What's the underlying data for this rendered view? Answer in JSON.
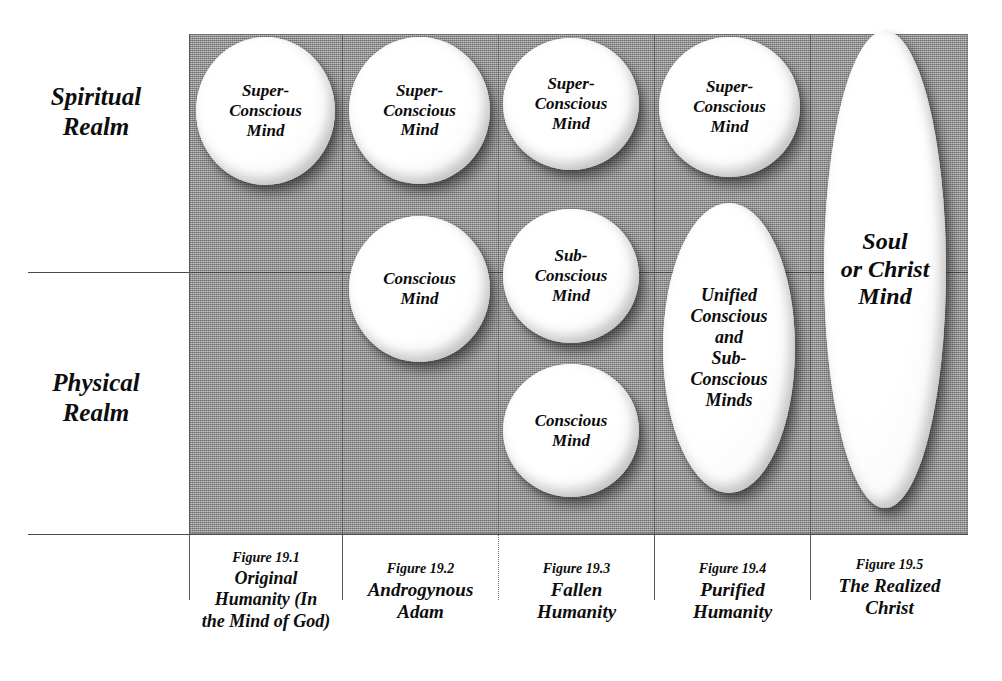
{
  "diagram": {
    "row_labels": [
      {
        "name": "spiritual-realm",
        "text": "Spiritual\nRealm"
      },
      {
        "name": "physical-realm",
        "text": "Physical\nRealm"
      }
    ],
    "columns": [
      {
        "id": "col-1",
        "figure_number": "Figure 19.1",
        "figure_title": "Original\nHumanity (In\nthe Mind of God)",
        "shapes": [
          {
            "id": "c1-super",
            "label": "Super-\nConscious\nMind"
          }
        ]
      },
      {
        "id": "col-2",
        "figure_number": "Figure 19.2",
        "figure_title": "Androgynous\nAdam",
        "shapes": [
          {
            "id": "c2-super",
            "label": "Super-\nConscious\nMind"
          },
          {
            "id": "c2-conscious",
            "label": "Conscious\nMind"
          }
        ]
      },
      {
        "id": "col-3",
        "figure_number": "Figure 19.3",
        "figure_title": "Fallen\nHumanity",
        "shapes": [
          {
            "id": "c3-super",
            "label": "Super-\nConscious\nMind"
          },
          {
            "id": "c3-sub",
            "label": "Sub-\nConscious\nMind"
          },
          {
            "id": "c3-conscious",
            "label": "Conscious\nMind"
          }
        ]
      },
      {
        "id": "col-4",
        "figure_number": "Figure 19.4",
        "figure_title": "Purified\nHumanity",
        "shapes": [
          {
            "id": "c4-super",
            "label": "Super-\nConscious\nMind"
          },
          {
            "id": "c4-unified",
            "label": "Unified\nConscious\nand\nSub-\nConscious\nMinds"
          }
        ]
      },
      {
        "id": "col-5",
        "figure_number": "Figure 19.5",
        "figure_title": "The Realized\nChrist",
        "shapes": [
          {
            "id": "c5-soul",
            "label": "Soul\nor Christ\nMind"
          }
        ]
      }
    ],
    "colors": {
      "panel_gray": "#9d9d9d",
      "shape_fill": "#ffffff",
      "line": "#4a4a4a",
      "text": "#0d0d0d"
    }
  }
}
